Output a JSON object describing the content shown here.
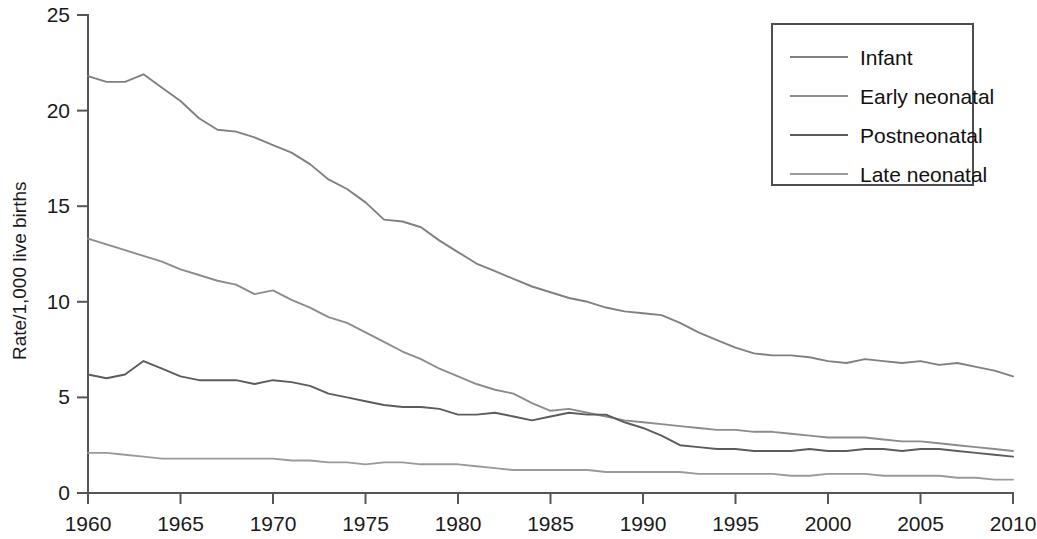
{
  "chart_data": {
    "type": "line",
    "title": "",
    "xlabel": "",
    "ylabel": "Rate/1,000 live births",
    "xlim": [
      1960,
      2010
    ],
    "ylim": [
      0,
      25
    ],
    "xticks": [
      1960,
      1965,
      1970,
      1975,
      1980,
      1985,
      1990,
      1995,
      2000,
      2005,
      2010
    ],
    "yticks": [
      0,
      5,
      10,
      15,
      20,
      25
    ],
    "xtick_labels": [
      "1960",
      "1965",
      "1970",
      "1975",
      "1980",
      "1985",
      "1990",
      "1995",
      "2000",
      "2005",
      "2010"
    ],
    "ytick_labels": [
      "0",
      "5",
      "10",
      "15",
      "20",
      "25"
    ],
    "grid": false,
    "legend_position": "top-right",
    "x": [
      1960,
      1961,
      1962,
      1963,
      1964,
      1965,
      1966,
      1967,
      1968,
      1969,
      1970,
      1971,
      1972,
      1973,
      1974,
      1975,
      1976,
      1977,
      1978,
      1979,
      1980,
      1981,
      1982,
      1983,
      1984,
      1985,
      1986,
      1987,
      1988,
      1989,
      1990,
      1991,
      1992,
      1993,
      1994,
      1995,
      1996,
      1997,
      1998,
      1999,
      2000,
      2001,
      2002,
      2003,
      2004,
      2005,
      2006,
      2007,
      2008,
      2009,
      2010
    ],
    "series": [
      {
        "name": "Infant",
        "color": "#808080",
        "values": [
          21.8,
          21.5,
          21.5,
          21.9,
          21.2,
          20.5,
          19.6,
          19.0,
          18.9,
          18.6,
          18.2,
          17.8,
          17.2,
          16.4,
          15.9,
          15.2,
          14.3,
          14.2,
          13.9,
          13.2,
          12.6,
          12.0,
          11.6,
          11.2,
          10.8,
          10.5,
          10.2,
          10.0,
          9.7,
          9.5,
          9.4,
          9.3,
          8.9,
          8.4,
          8.0,
          7.6,
          7.3,
          7.2,
          7.2,
          7.1,
          6.9,
          6.8,
          7.0,
          6.9,
          6.8,
          6.9,
          6.7,
          6.8,
          6.6,
          6.4,
          6.1
        ],
        "values_scale_note": "Infant mortality rate per 1,000 live births"
      },
      {
        "name": "Early neonatal",
        "color": "#8c8c8c",
        "values": [
          13.3,
          13.0,
          12.7,
          12.4,
          12.1,
          11.7,
          11.4,
          11.1,
          10.9,
          10.4,
          10.6,
          10.1,
          9.7,
          9.2,
          8.9,
          8.4,
          7.9,
          7.4,
          7.0,
          6.5,
          6.1,
          5.7,
          5.4,
          5.2,
          4.7,
          4.3,
          4.4,
          4.2,
          4.0,
          3.8,
          3.7,
          3.6,
          3.5,
          3.4,
          3.3,
          3.3,
          3.2,
          3.2,
          3.1,
          3.0,
          2.9,
          2.9,
          2.9,
          2.8,
          2.7,
          2.7,
          2.6,
          2.5,
          2.4,
          2.3,
          2.2
        ],
        "values_scale_note": "Early neonatal (0-6 days) mortality rate"
      },
      {
        "name": "Postneonatal",
        "color": "#5c5c5c",
        "values": [
          6.2,
          6.0,
          6.2,
          6.9,
          6.5,
          6.1,
          5.9,
          5.9,
          5.9,
          5.7,
          5.9,
          5.8,
          5.6,
          5.2,
          5.0,
          4.8,
          4.6,
          4.5,
          4.5,
          4.4,
          4.1,
          4.1,
          4.2,
          4.0,
          3.8,
          4.0,
          4.2,
          4.1,
          4.1,
          3.7,
          3.4,
          3.0,
          2.5,
          2.4,
          2.3,
          2.3,
          2.2,
          2.2,
          2.2,
          2.3,
          2.2,
          2.2,
          2.3,
          2.3,
          2.2,
          2.3,
          2.3,
          2.2,
          2.1,
          2.0,
          1.9
        ],
        "values_scale_note": "Postneonatal (28-364 days) mortality rate"
      },
      {
        "name": "Late neonatal",
        "color": "#9a9a9a",
        "values": [
          2.1,
          2.1,
          2.0,
          1.9,
          1.8,
          1.8,
          1.8,
          1.8,
          1.8,
          1.8,
          1.8,
          1.7,
          1.7,
          1.6,
          1.6,
          1.5,
          1.6,
          1.6,
          1.5,
          1.5,
          1.5,
          1.4,
          1.3,
          1.2,
          1.2,
          1.2,
          1.2,
          1.2,
          1.1,
          1.1,
          1.1,
          1.1,
          1.1,
          1.0,
          1.0,
          1.0,
          1.0,
          1.0,
          0.9,
          0.9,
          1.0,
          1.0,
          1.0,
          0.9,
          0.9,
          0.9,
          0.9,
          0.8,
          0.8,
          0.7,
          0.7
        ],
        "values_scale_note": "Late neonatal (7-27 days) mortality rate"
      }
    ]
  },
  "legend": {
    "entries": [
      {
        "label": "Infant"
      },
      {
        "label": "Early neonatal"
      },
      {
        "label": "Postneonatal"
      },
      {
        "label": "Late neonatal"
      }
    ]
  }
}
